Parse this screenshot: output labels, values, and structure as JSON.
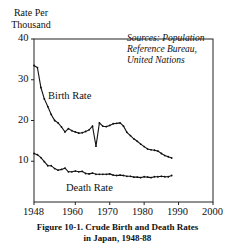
{
  "chart_data": {
    "type": "line",
    "title": "Figure 10-1. Crude Birth and Death Rates in Japan, 1948-88",
    "ylabel": "Rate Per Thousand",
    "xlabel": "",
    "ylim": [
      0,
      40
    ],
    "xlim": [
      1948,
      2000
    ],
    "yticks": [
      10,
      20,
      30,
      40
    ],
    "xticks": [
      1948,
      1960,
      1970,
      1980,
      1990,
      2000
    ],
    "grid": false,
    "annotation": "Sources: Population Reference Bureau, United Nations",
    "series": [
      {
        "name": "Birth Rate",
        "x": [
          1948,
          1949,
          1950,
          1951,
          1952,
          1953,
          1954,
          1955,
          1956,
          1957,
          1958,
          1959,
          1960,
          1961,
          1962,
          1963,
          1964,
          1965,
          1966,
          1967,
          1968,
          1969,
          1970,
          1971,
          1972,
          1973,
          1974,
          1975,
          1976,
          1977,
          1978,
          1979,
          1980,
          1981,
          1982,
          1983,
          1984,
          1985,
          1986,
          1987,
          1988
        ],
        "values": [
          33.5,
          33.0,
          28.1,
          25.3,
          23.4,
          21.5,
          20.0,
          19.4,
          18.4,
          17.2,
          18.0,
          17.5,
          17.2,
          16.9,
          17.0,
          17.3,
          17.7,
          18.6,
          13.7,
          19.4,
          18.6,
          18.5,
          18.8,
          19.2,
          19.3,
          19.4,
          18.6,
          17.1,
          16.3,
          15.5,
          14.9,
          14.2,
          13.6,
          13.0,
          12.8,
          12.7,
          12.5,
          11.9,
          11.4,
          11.1,
          10.8
        ]
      },
      {
        "name": "Death Rate",
        "x": [
          1948,
          1949,
          1950,
          1951,
          1952,
          1953,
          1954,
          1955,
          1956,
          1957,
          1958,
          1959,
          1960,
          1961,
          1962,
          1963,
          1964,
          1965,
          1966,
          1967,
          1968,
          1969,
          1970,
          1971,
          1972,
          1973,
          1974,
          1975,
          1976,
          1977,
          1978,
          1979,
          1980,
          1981,
          1982,
          1983,
          1984,
          1985,
          1986,
          1987,
          1988
        ],
        "values": [
          11.9,
          11.6,
          10.9,
          9.9,
          8.9,
          8.9,
          8.2,
          7.8,
          8.0,
          8.3,
          7.4,
          7.4,
          7.6,
          7.4,
          7.5,
          7.0,
          6.9,
          7.1,
          6.8,
          6.8,
          6.8,
          6.8,
          6.9,
          6.6,
          6.5,
          6.6,
          6.5,
          6.3,
          6.3,
          6.1,
          6.1,
          6.0,
          6.2,
          6.1,
          6.0,
          6.2,
          6.2,
          6.3,
          6.2,
          6.2,
          6.5
        ]
      }
    ]
  },
  "labels": {
    "ylabel_line1": "Rate Per",
    "ylabel_line2": "Thousand",
    "y40": "40",
    "y30": "30",
    "y20": "20",
    "y10": "10",
    "x1948": "1948",
    "x1960": "1960",
    "x1970": "1970",
    "x1980": "1980",
    "x1990": "1990",
    "x2000": "2000",
    "source1": "Sources: Population",
    "source2": "Reference Bureau,",
    "source3": "United Nations",
    "birth": "Birth Rate",
    "death": "Death Rate",
    "caption1": "Figure 10-1. Crude Birth and Death Rates",
    "caption2": "in Japan, 1948-88"
  }
}
